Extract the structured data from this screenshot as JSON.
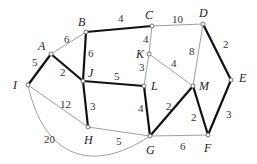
{
  "graph": {
    "nodes": [
      {
        "id": "A",
        "x": 51,
        "y": 54,
        "lx": 38,
        "ly": 50
      },
      {
        "id": "B",
        "x": 86,
        "y": 32,
        "lx": 78,
        "ly": 26
      },
      {
        "id": "C",
        "x": 152,
        "y": 26,
        "lx": 145,
        "ly": 19
      },
      {
        "id": "D",
        "x": 203,
        "y": 24,
        "lx": 199,
        "ly": 17
      },
      {
        "id": "E",
        "x": 231,
        "y": 80,
        "lx": 239,
        "ly": 82
      },
      {
        "id": "F",
        "x": 208,
        "y": 135,
        "lx": 204,
        "ly": 152
      },
      {
        "id": "G",
        "x": 150,
        "y": 136,
        "lx": 146,
        "ly": 154
      },
      {
        "id": "H",
        "x": 88,
        "y": 127,
        "lx": 84,
        "ly": 144
      },
      {
        "id": "I",
        "x": 28,
        "y": 85,
        "lx": 13,
        "ly": 89
      },
      {
        "id": "J",
        "x": 83,
        "y": 81,
        "lx": 88,
        "ly": 77
      },
      {
        "id": "K",
        "x": 149,
        "y": 54,
        "lx": 136,
        "ly": 58
      },
      {
        "id": "L",
        "x": 144,
        "y": 86,
        "lx": 151,
        "ly": 90
      },
      {
        "id": "M",
        "x": 193,
        "y": 86,
        "lx": 199,
        "ly": 90
      }
    ],
    "edges": [
      {
        "from": "A",
        "to": "B",
        "weight": "6",
        "bold": false,
        "wx": 64,
        "wy": 43
      },
      {
        "from": "A",
        "to": "I",
        "weight": "5",
        "bold": true,
        "wx": 32,
        "wy": 66
      },
      {
        "from": "A",
        "to": "J",
        "weight": "2",
        "bold": true,
        "wx": 60,
        "wy": 76
      },
      {
        "from": "B",
        "to": "J",
        "weight": "6",
        "bold": true,
        "wx": 88,
        "wy": 57
      },
      {
        "from": "B",
        "to": "C",
        "weight": "4",
        "bold": true,
        "wx": 118,
        "wy": 22
      },
      {
        "from": "C",
        "to": "D",
        "weight": "10",
        "bold": false,
        "wx": 172,
        "wy": 23
      },
      {
        "from": "C",
        "to": "K",
        "weight": "4",
        "bold": false,
        "wx": 143,
        "wy": 43
      },
      {
        "from": "D",
        "to": "E",
        "weight": "2",
        "bold": true,
        "wx": 223,
        "wy": 48
      },
      {
        "from": "D",
        "to": "M",
        "weight": "8",
        "bold": false,
        "wx": 189,
        "wy": 55
      },
      {
        "from": "K",
        "to": "L",
        "weight": "3",
        "bold": false,
        "wx": 139,
        "wy": 71
      },
      {
        "from": "K",
        "to": "M",
        "weight": "4",
        "bold": false,
        "wx": 171,
        "wy": 67
      },
      {
        "from": "J",
        "to": "L",
        "weight": "5",
        "bold": true,
        "wx": 114,
        "wy": 80
      },
      {
        "from": "J",
        "to": "H",
        "weight": "3",
        "bold": true,
        "wx": 90,
        "wy": 110
      },
      {
        "from": "I",
        "to": "H",
        "weight": "12",
        "bold": false,
        "wx": 60,
        "wy": 108
      },
      {
        "from": "I",
        "to": "G",
        "weight": "20",
        "bold": false,
        "curve": true,
        "wx": 44,
        "wy": 143
      },
      {
        "from": "H",
        "to": "G",
        "weight": "5",
        "bold": false,
        "wx": 116,
        "wy": 145
      },
      {
        "from": "L",
        "to": "G",
        "weight": "4",
        "bold": true,
        "wx": 138,
        "wy": 112
      },
      {
        "from": "G",
        "to": "M",
        "weight": "2",
        "bold": true,
        "wx": 166,
        "wy": 110
      },
      {
        "from": "M",
        "to": "F",
        "weight": "2",
        "bold": true,
        "wx": 191,
        "wy": 121
      },
      {
        "from": "E",
        "to": "F",
        "weight": "3",
        "bold": true,
        "wx": 226,
        "wy": 118
      },
      {
        "from": "G",
        "to": "F",
        "weight": "6",
        "bold": false,
        "wx": 180,
        "wy": 150
      }
    ]
  },
  "colors": {
    "bold_edge": "#111111",
    "thin_edge": "#888888",
    "node": "#555555"
  }
}
